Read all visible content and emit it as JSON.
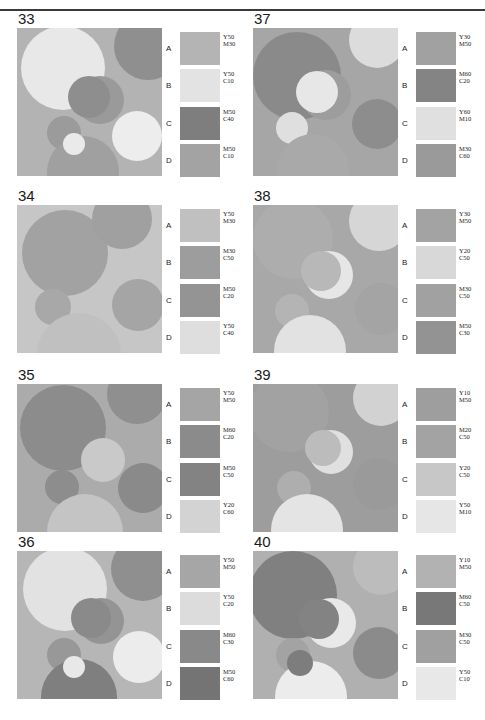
{
  "page": {
    "running_header_left": "",
    "running_header_right": "",
    "divider": "horizontal-rule",
    "columns": 2,
    "rows": 4
  },
  "swatch_row_labels": [
    "A",
    "B",
    "C",
    "D"
  ],
  "panels": [
    {
      "number": "33",
      "art": {
        "background": "#b3b3b3",
        "circles": [
          {
            "cx": 46,
            "cy": 40,
            "r": 42,
            "fill": "#e8e8e8"
          },
          {
            "cx": 131,
            "cy": 18,
            "r": 34,
            "fill": "#8f8f8f"
          },
          {
            "cx": 83,
            "cy": 72,
            "r": 24,
            "fill": "#9a9a9a"
          },
          {
            "cx": 72,
            "cy": 69,
            "r": 21,
            "fill": "#8e8e8e"
          },
          {
            "cx": 120,
            "cy": 108,
            "r": 25,
            "fill": "#ededed"
          },
          {
            "cx": 47,
            "cy": 105,
            "r": 17,
            "fill": "#9b9b9b"
          },
          {
            "cx": 66,
            "cy": 144,
            "r": 36,
            "fill": "#a0a0a0"
          },
          {
            "cx": 57,
            "cy": 116,
            "r": 11,
            "fill": "#eaeaea"
          }
        ]
      },
      "swatches": [
        {
          "label": "A",
          "color": "#b4b4b4",
          "ink": [
            "Y50",
            "M30"
          ]
        },
        {
          "label": "B",
          "color": "#e3e3e3",
          "ink": [
            "Y50",
            "C10"
          ]
        },
        {
          "label": "C",
          "color": "#7e7e7e",
          "ink": [
            "M50",
            "C40"
          ]
        },
        {
          "label": "D",
          "color": "#a3a3a3",
          "ink": [
            "M50",
            "C10"
          ]
        }
      ]
    },
    {
      "number": "37",
      "art": {
        "background": "#a6a6a6",
        "circles": [
          {
            "cx": 44,
            "cy": 48,
            "r": 44,
            "fill": "#8a8a8a"
          },
          {
            "cx": 124,
            "cy": 12,
            "r": 28,
            "fill": "#dcdcdc"
          },
          {
            "cx": 73,
            "cy": 67,
            "r": 25,
            "fill": "#9d9d9d"
          },
          {
            "cx": 64,
            "cy": 64,
            "r": 21,
            "fill": "#e7e7e7"
          },
          {
            "cx": 124,
            "cy": 96,
            "r": 25,
            "fill": "#8d8d8d"
          },
          {
            "cx": 39,
            "cy": 100,
            "r": 16,
            "fill": "#dfdfdf"
          },
          {
            "cx": 60,
            "cy": 142,
            "r": 36,
            "fill": "#a9a9a9"
          }
        ]
      },
      "swatches": [
        {
          "label": "A",
          "color": "#a1a1a1",
          "ink": [
            "Y30",
            "M50"
          ]
        },
        {
          "label": "B",
          "color": "#848484",
          "ink": [
            "M60",
            "C20"
          ]
        },
        {
          "label": "C",
          "color": "#e0e0e0",
          "ink": [
            "Y60",
            "M10"
          ]
        },
        {
          "label": "D",
          "color": "#9a9a9a",
          "ink": [
            "M30",
            "C60"
          ]
        }
      ]
    },
    {
      "number": "34",
      "art": {
        "background": "#c6c6c6",
        "circles": [
          {
            "cx": 48,
            "cy": 48,
            "r": 43,
            "fill": "#a2a2a2"
          },
          {
            "cx": 105,
            "cy": 14,
            "r": 30,
            "fill": "#a0a0a0"
          },
          {
            "cx": 121,
            "cy": 100,
            "r": 26,
            "fill": "#a5a5a5"
          },
          {
            "cx": 36,
            "cy": 102,
            "r": 18,
            "fill": "#a8a8a8"
          },
          {
            "cx": 62,
            "cy": 150,
            "r": 42,
            "fill": "#c0c0c0"
          }
        ]
      },
      "swatches": [
        {
          "label": "A",
          "color": "#c0c0c0",
          "ink": [
            "Y50",
            "M30"
          ]
        },
        {
          "label": "B",
          "color": "#9d9d9d",
          "ink": [
            "M30",
            "C50"
          ]
        },
        {
          "label": "C",
          "color": "#949494",
          "ink": [
            "M50",
            "C20"
          ]
        },
        {
          "label": "D",
          "color": "#dedede",
          "ink": [
            "Y50",
            "C40"
          ]
        }
      ]
    },
    {
      "number": "38",
      "art": {
        "background": "#a8a8a8",
        "circles": [
          {
            "cx": 40,
            "cy": 34,
            "r": 40,
            "fill": "#adadad"
          },
          {
            "cx": 126,
            "cy": 16,
            "r": 30,
            "fill": "#d6d6d6"
          },
          {
            "cx": 76,
            "cy": 70,
            "r": 24,
            "fill": "#e6e6e6"
          },
          {
            "cx": 68,
            "cy": 66,
            "r": 20,
            "fill": "#b8b8b8"
          },
          {
            "cx": 128,
            "cy": 104,
            "r": 26,
            "fill": "#a4a4a4"
          },
          {
            "cx": 39,
            "cy": 106,
            "r": 17,
            "fill": "#b4b4b4"
          },
          {
            "cx": 57,
            "cy": 146,
            "r": 36,
            "fill": "#e2e2e2"
          }
        ]
      },
      "swatches": [
        {
          "label": "A",
          "color": "#a3a3a3",
          "ink": [
            "Y30",
            "M50"
          ]
        },
        {
          "label": "B",
          "color": "#d8d8d8",
          "ink": [
            "Y20",
            "C50"
          ]
        },
        {
          "label": "C",
          "color": "#a1a1a1",
          "ink": [
            "M30",
            "C50"
          ]
        },
        {
          "label": "D",
          "color": "#939393",
          "ink": [
            "M50",
            "C30"
          ]
        }
      ]
    },
    {
      "number": "35",
      "art": {
        "background": "#ababab",
        "circles": [
          {
            "cx": 46,
            "cy": 44,
            "r": 43,
            "fill": "#8c8c8c"
          },
          {
            "cx": 120,
            "cy": 10,
            "r": 30,
            "fill": "#8f8f8f"
          },
          {
            "cx": 86,
            "cy": 76,
            "r": 22,
            "fill": "#c9c9c9"
          },
          {
            "cx": 126,
            "cy": 104,
            "r": 25,
            "fill": "#8a8a8a"
          },
          {
            "cx": 45,
            "cy": 103,
            "r": 17,
            "fill": "#8d8d8d"
          },
          {
            "cx": 68,
            "cy": 148,
            "r": 38,
            "fill": "#c4c4c4"
          }
        ]
      },
      "swatches": [
        {
          "label": "A",
          "color": "#a5a5a5",
          "ink": [
            "Y50",
            "M50"
          ]
        },
        {
          "label": "B",
          "color": "#8b8b8b",
          "ink": [
            "M60",
            "C20"
          ]
        },
        {
          "label": "C",
          "color": "#838383",
          "ink": [
            "M50",
            "C50"
          ]
        },
        {
          "label": "D",
          "color": "#d3d3d3",
          "ink": [
            "Y20",
            "C60"
          ]
        }
      ]
    },
    {
      "number": "39",
      "art": {
        "background": "#9d9d9d",
        "circles": [
          {
            "cx": 36,
            "cy": 28,
            "r": 40,
            "fill": "#a2a2a2"
          },
          {
            "cx": 128,
            "cy": 14,
            "r": 28,
            "fill": "#d2d2d2"
          },
          {
            "cx": 78,
            "cy": 68,
            "r": 22,
            "fill": "#e0e0e0"
          },
          {
            "cx": 70,
            "cy": 64,
            "r": 18,
            "fill": "#bcbcbc"
          },
          {
            "cx": 126,
            "cy": 100,
            "r": 26,
            "fill": "#9a9a9a"
          },
          {
            "cx": 41,
            "cy": 104,
            "r": 17,
            "fill": "#aeaeae"
          },
          {
            "cx": 54,
            "cy": 146,
            "r": 36,
            "fill": "#e4e4e4"
          }
        ]
      },
      "swatches": [
        {
          "label": "A",
          "color": "#9e9e9e",
          "ink": [
            "Y10",
            "M50"
          ]
        },
        {
          "label": "B",
          "color": "#a3a3a3",
          "ink": [
            "M20",
            "C50"
          ]
        },
        {
          "label": "C",
          "color": "#c7c7c7",
          "ink": [
            "Y20",
            "C50"
          ]
        },
        {
          "label": "D",
          "color": "#e6e6e6",
          "ink": [
            "Y50",
            "M10"
          ]
        }
      ]
    },
    {
      "number": "36",
      "art": {
        "background": "#b6b6b6",
        "circles": [
          {
            "cx": 48,
            "cy": 38,
            "r": 42,
            "fill": "#e2e2e2"
          },
          {
            "cx": 126,
            "cy": 18,
            "r": 32,
            "fill": "#8f8f8f"
          },
          {
            "cx": 84,
            "cy": 70,
            "r": 23,
            "fill": "#949494"
          },
          {
            "cx": 74,
            "cy": 67,
            "r": 20,
            "fill": "#8a8a8a"
          },
          {
            "cx": 122,
            "cy": 106,
            "r": 26,
            "fill": "#ececec"
          },
          {
            "cx": 47,
            "cy": 104,
            "r": 17,
            "fill": "#989898"
          },
          {
            "cx": 62,
            "cy": 146,
            "r": 38,
            "fill": "#7f7f7f"
          },
          {
            "cx": 57,
            "cy": 116,
            "r": 11,
            "fill": "#e8e8e8"
          }
        ]
      },
      "swatches": [
        {
          "label": "A",
          "color": "#a6a6a6",
          "ink": [
            "Y50",
            "M50"
          ]
        },
        {
          "label": "B",
          "color": "#dcdcdc",
          "ink": [
            "Y50",
            "C20"
          ]
        },
        {
          "label": "C",
          "color": "#898989",
          "ink": [
            "M60",
            "C30"
          ]
        },
        {
          "label": "D",
          "color": "#747474",
          "ink": [
            "M50",
            "C60"
          ]
        }
      ]
    },
    {
      "number": "40",
      "art": {
        "background": "#b0b0b0",
        "circles": [
          {
            "cx": 40,
            "cy": 44,
            "r": 44,
            "fill": "#808080"
          },
          {
            "cx": 128,
            "cy": 16,
            "r": 28,
            "fill": "#bcbcbc"
          },
          {
            "cx": 78,
            "cy": 72,
            "r": 25,
            "fill": "#e9e9e9"
          },
          {
            "cx": 66,
            "cy": 68,
            "r": 20,
            "fill": "#838383"
          },
          {
            "cx": 126,
            "cy": 102,
            "r": 26,
            "fill": "#8b8b8b"
          },
          {
            "cx": 40,
            "cy": 104,
            "r": 17,
            "fill": "#a3a3a3"
          },
          {
            "cx": 58,
            "cy": 146,
            "r": 36,
            "fill": "#ececec"
          },
          {
            "cx": 47,
            "cy": 112,
            "r": 13,
            "fill": "#7d7d7d"
          }
        ]
      },
      "swatches": [
        {
          "label": "A",
          "color": "#b2b2b2",
          "ink": [
            "Y10",
            "M50"
          ]
        },
        {
          "label": "B",
          "color": "#787878",
          "ink": [
            "M60",
            "C50"
          ]
        },
        {
          "label": "C",
          "color": "#a0a0a0",
          "ink": [
            "M30",
            "C50"
          ]
        },
        {
          "label": "D",
          "color": "#e8e8e8",
          "ink": [
            "Y50",
            "C10"
          ]
        }
      ]
    }
  ]
}
